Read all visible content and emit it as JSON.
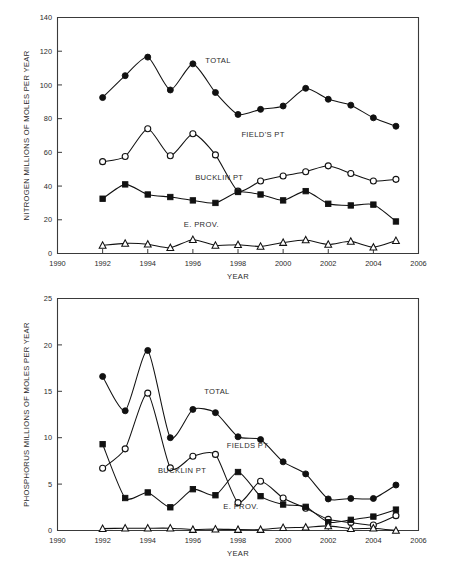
{
  "figure": {
    "background": "#ffffff",
    "line_color": "#111111",
    "axis_color": "#3a3a3a"
  },
  "chart_data": [
    {
      "id": "nitrogen",
      "type": "line",
      "title": "",
      "xlabel": "YEAR",
      "ylabel": "NITROGEN MILLIONS OF MOLES PER YEAR",
      "xlim": [
        1990,
        2006
      ],
      "ylim": [
        0,
        140
      ],
      "xticks": [
        1990,
        1992,
        1994,
        1996,
        1998,
        2000,
        2002,
        2004,
        2006
      ],
      "yticks": [
        0,
        20,
        40,
        60,
        80,
        100,
        120,
        140
      ],
      "grid": false,
      "legend_position": "inline-annotations",
      "x": [
        1992,
        1993,
        1994,
        1995,
        1996,
        1997,
        1998,
        1999,
        2000,
        2001,
        2002,
        2003,
        2004,
        2005
      ],
      "series": [
        {
          "name": "TOTAL",
          "marker": "filled-circle",
          "label_x": 1996.55,
          "label_y": 113,
          "values": [
            92.5,
            105.5,
            116.5,
            97.0,
            112.5,
            95.5,
            82.5,
            85.5,
            87.5,
            98.0,
            91.5,
            88.0,
            80.5,
            75.5
          ]
        },
        {
          "name": "FIELD'S PT",
          "marker": "open-circle",
          "label_x": 1998.15,
          "label_y": 69,
          "values": [
            54.5,
            57.5,
            74.0,
            58.0,
            71.0,
            58.5,
            37.0,
            43.0,
            46.0,
            48.5,
            52.0,
            47.5,
            43.0,
            44.0
          ]
        },
        {
          "name": "BUCKLIN PT",
          "marker": "filled-square",
          "label_x": 1996.1,
          "label_y": 43.5,
          "values": [
            32.5,
            41.0,
            35.0,
            33.5,
            31.5,
            30.0,
            36.5,
            35.0,
            31.5,
            37.0,
            29.5,
            28.5,
            29.0,
            19.0
          ]
        },
        {
          "name": "E. PROV.",
          "marker": "open-triangle",
          "label_x": 1995.6,
          "label_y": 15.5,
          "values": [
            4.8,
            6.0,
            5.5,
            3.4,
            8.2,
            4.8,
            5.2,
            4.2,
            6.5,
            8.0,
            5.4,
            7.2,
            3.7,
            7.6
          ]
        }
      ]
    },
    {
      "id": "phosphorus",
      "type": "line",
      "title": "",
      "xlabel": "YEAR",
      "ylabel": "PHOSPHORUS MILLIONS OF MOLES PER YEAR",
      "xlim": [
        1990,
        2006
      ],
      "ylim": [
        0,
        25
      ],
      "xticks": [
        1990,
        1992,
        1994,
        1996,
        1998,
        2000,
        2002,
        2004,
        2006
      ],
      "yticks": [
        0,
        5,
        10,
        15,
        20,
        25
      ],
      "grid": false,
      "legend_position": "inline-annotations",
      "x": [
        1992,
        1993,
        1994,
        1995,
        1996,
        1997,
        1998,
        1999,
        2000,
        2001,
        2002,
        2003,
        2004,
        2005
      ],
      "series": [
        {
          "name": "TOTAL",
          "marker": "filled-circle",
          "label_x": 1996.5,
          "label_y": 14.7,
          "values": [
            16.6,
            12.9,
            19.4,
            10.0,
            13.05,
            12.7,
            10.1,
            9.8,
            7.4,
            6.1,
            3.4,
            3.45,
            3.45,
            4.9
          ]
        },
        {
          "name": "FIELDS PT",
          "marker": "open-circle",
          "label_x": 1997.5,
          "label_y": 8.85,
          "values": [
            6.7,
            8.8,
            14.8,
            6.75,
            8.0,
            8.2,
            3.0,
            5.3,
            3.5,
            2.4,
            1.2,
            0.85,
            0.6,
            1.6
          ]
        },
        {
          "name": "BUCKLIN PT",
          "marker": "filled-square",
          "label_x": 1994.45,
          "label_y": 6.15,
          "values": [
            9.3,
            3.5,
            4.1,
            2.5,
            4.45,
            3.8,
            6.3,
            3.7,
            2.8,
            2.55,
            0.9,
            1.15,
            1.5,
            2.25
          ]
        },
        {
          "name": "E. PROV.",
          "marker": "open-triangle",
          "label_x": 1997.35,
          "label_y": 2.35,
          "values": [
            0.2,
            0.25,
            0.25,
            0.25,
            0.1,
            0.15,
            0.1,
            0.1,
            0.3,
            0.35,
            0.5,
            0.2,
            0.25,
            0.0
          ]
        }
      ]
    }
  ]
}
